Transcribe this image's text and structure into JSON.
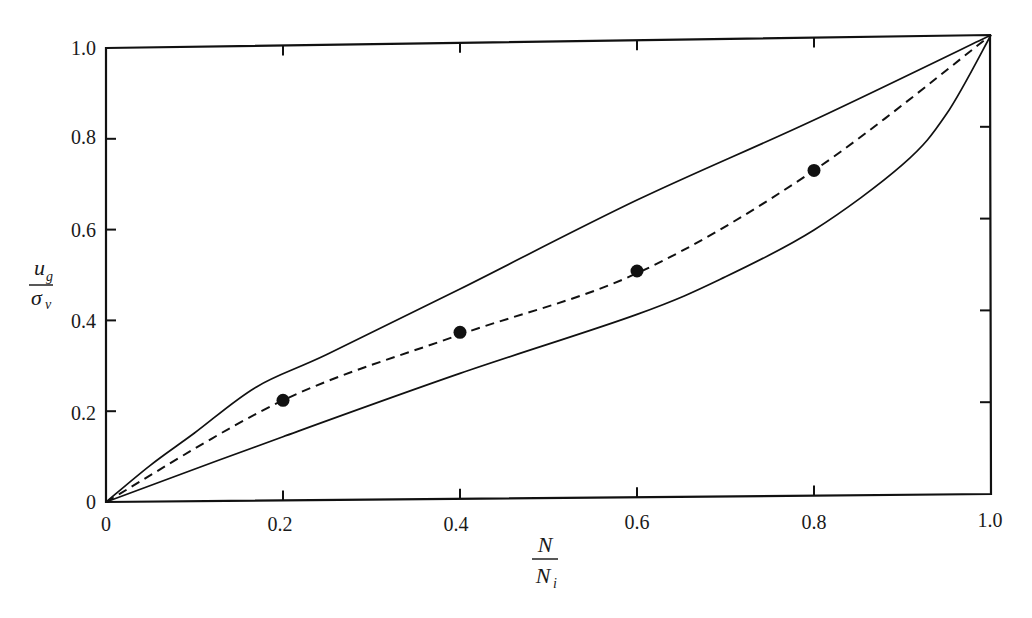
{
  "chart_data": {
    "type": "line",
    "title": "",
    "xlabel": "N / N_i",
    "ylabel": "u_g / σ_v",
    "xlim": [
      0,
      1.0
    ],
    "ylim": [
      0,
      1.0
    ],
    "grid": false,
    "legend": null,
    "x_ticks": [
      "0",
      "0.2",
      "0.4",
      "0.6",
      "0.8",
      "1.0"
    ],
    "y_ticks": [
      "0",
      "0.2",
      "0.4",
      "0.6",
      "0.8",
      "1.0"
    ],
    "series": [
      {
        "name": "upper bound",
        "style": "solid",
        "x": [
          0,
          0.05,
          0.1,
          0.17,
          0.25,
          0.4,
          0.6,
          0.8,
          1.0
        ],
        "y": [
          0,
          0.08,
          0.15,
          0.25,
          0.32,
          0.46,
          0.65,
          0.82,
          1.0
        ]
      },
      {
        "name": "lower bound",
        "style": "solid",
        "x": [
          0,
          0.2,
          0.4,
          0.6,
          0.7,
          0.8,
          0.9,
          0.95,
          1.0
        ],
        "y": [
          0,
          0.14,
          0.275,
          0.4,
          0.48,
          0.58,
          0.72,
          0.83,
          1.0
        ]
      },
      {
        "name": "mean curve",
        "style": "dashed",
        "x": [
          0,
          0.2,
          0.4,
          0.6,
          0.8,
          1.0
        ],
        "y": [
          0,
          0.22,
          0.36,
          0.49,
          0.71,
          1.0
        ]
      },
      {
        "name": "data points",
        "style": "markers",
        "x": [
          0.2,
          0.4,
          0.6,
          0.8
        ],
        "y": [
          0.22,
          0.365,
          0.495,
          0.71
        ]
      }
    ]
  },
  "labels": {
    "x_num": "N",
    "x_den": "N",
    "x_den_sub": "i",
    "y_num": "u",
    "y_num_sub": "g",
    "y_den": "σ",
    "y_den_sub": "v",
    "x_ticks": [
      "0",
      "0.2",
      "0.4",
      "0.6",
      "0.8",
      "1.0"
    ],
    "y_ticks": [
      "0",
      "0.2",
      "0.4",
      "0.6",
      "0.8",
      "1.0"
    ]
  }
}
